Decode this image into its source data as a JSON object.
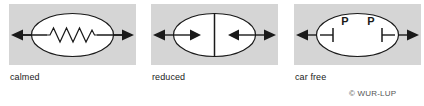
{
  "figure": {
    "title": "",
    "credit": "© WUR-LUP",
    "credit_symbol": "©",
    "credit_text": "WUR-LUP",
    "background_color": "#ffffff",
    "panel_color": "#d5d5d5",
    "stroke_color": "#1a1a1a",
    "fill_color": "#ffffff"
  },
  "panels": [
    {
      "id": "calmed",
      "caption": "calmed",
      "symbol_name": "zigzag-traffic-calming",
      "description": "ellipse with through arrow and zigzag (traffic calmed street)",
      "arrow_left": "left-arrowhead",
      "arrow_right": "right-arrowhead",
      "zigzag_peaks": 6
    },
    {
      "id": "reduced",
      "caption": "reduced",
      "symbol_name": "divided-inward-arrows",
      "description": "ellipse split by vertical barrier line with two inward arrows (reduced traffic)",
      "arrow_left": "left-arrowhead",
      "arrow_right": "right-arrowhead",
      "inner_arrow_left": "right-arrowhead",
      "inner_arrow_right": "left-arrowhead",
      "divider": "vertical-line"
    },
    {
      "id": "car-free",
      "caption": "car free",
      "symbol_name": "parking-barriers",
      "description": "ellipse with two P parking labels and barrier end stops (car free area)",
      "arrow_left": "left-arrowhead",
      "arrow_right": "right-arrowhead",
      "parking_labels": [
        "P",
        "P"
      ],
      "barriers": [
        "barrier-left",
        "barrier-right"
      ]
    }
  ]
}
